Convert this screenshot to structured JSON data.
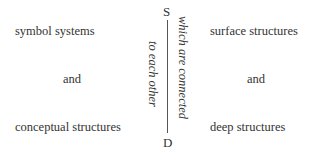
{
  "left": {
    "top": "symbol systems",
    "middle": "and",
    "bottom": "conceptual structures"
  },
  "right": {
    "top": "surface structures",
    "middle": "and",
    "bottom": "deep structures"
  },
  "axis": {
    "top_label": "S",
    "bottom_label": "D",
    "right_caption": "which are connected",
    "left_caption": "to each other"
  }
}
